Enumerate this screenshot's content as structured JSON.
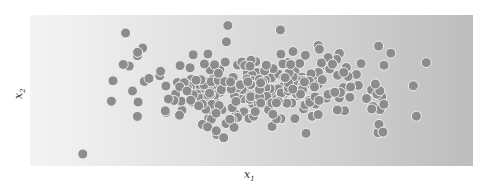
{
  "chart_data": {
    "type": "scatter",
    "title": "",
    "xlabel": "x1",
    "ylabel": "x2",
    "xlim": [
      -4,
      4
    ],
    "ylim": [
      -3,
      3
    ],
    "grid": false,
    "legend": null,
    "marker": {
      "color": "#8c8c8c",
      "edge": "#f0f0f0",
      "radius_px": 5
    },
    "distribution": {
      "kind": "2d-gaussian",
      "mean": [
        0.2,
        0.1
      ],
      "std": [
        1.2,
        0.75
      ],
      "n": 300,
      "seed": 7
    }
  },
  "labels": {
    "x_main": "x",
    "x_sub": "1",
    "y_main": "x",
    "y_sub": "2"
  }
}
